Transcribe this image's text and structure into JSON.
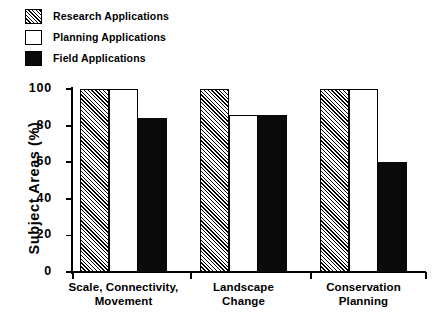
{
  "chart_data": {
    "type": "bar",
    "title": "",
    "xlabel": "",
    "ylabel": "Subject Areas (%)",
    "ylim": [
      0,
      100
    ],
    "yticks": [
      0,
      20,
      40,
      60,
      80,
      100
    ],
    "ytick_labels": [
      "0",
      "20",
      "40",
      "60",
      "80",
      "100"
    ],
    "grid": false,
    "legend_position": "top-left",
    "categories": [
      "Scale, Connectivity, Movement",
      "Landscape Change",
      "Conservation Planning"
    ],
    "category_lines": [
      [
        "Scale, Connectivity,",
        "Movement"
      ],
      [
        "Landscape",
        "Change"
      ],
      [
        "Conservation",
        "Planning"
      ]
    ],
    "series": [
      {
        "name": "Research Applications",
        "fill": "hatch",
        "values": [
          100,
          100,
          100
        ]
      },
      {
        "name": "Planning Applications",
        "fill": "open",
        "values": [
          100,
          86,
          100
        ]
      },
      {
        "name": "Field Applications",
        "fill": "solid",
        "values": [
          84,
          86,
          60
        ]
      }
    ]
  },
  "legend": {
    "items": [
      {
        "label": "Research Applications",
        "swatch": "hatch"
      },
      {
        "label": "Planning Applications",
        "swatch": "open"
      },
      {
        "label": "Field Applications",
        "swatch": "solid"
      }
    ]
  },
  "colors": {
    "foreground": "#000000",
    "background": "#ffffff",
    "solid_fill": "#0a0a0a"
  }
}
